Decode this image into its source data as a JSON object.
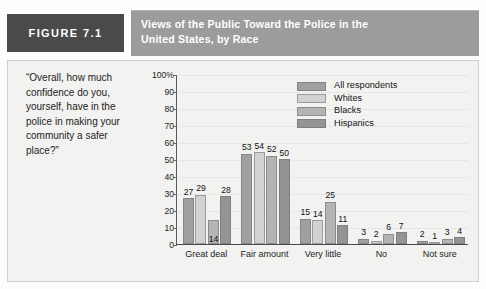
{
  "figure": {
    "badge_label": "FIGURE 7.1",
    "title_line1": "Views of the Public Toward the Police in the",
    "title_line2": "United States, by Race",
    "quote": "“Overall, how much confidence do you, yourself, have in the police in making your community a safer place?”"
  },
  "colors": {
    "badge_bg": "#4a4a4a",
    "title_bg": "#9c9c9c",
    "panel_bg": "#f2f2f0",
    "series_all": "#a0a0a0",
    "series_whites": "#d2d2d2",
    "series_blacks": "#b4b4b4",
    "series_hispanics": "#949494"
  },
  "chart_data": {
    "type": "bar",
    "title": "Views of the Public Toward the Police in the United States, by Race",
    "xlabel": "",
    "ylabel": "",
    "ylim": [
      0,
      100
    ],
    "yticks": [
      "0",
      "10",
      "20",
      "30",
      "40",
      "50",
      "60",
      "70",
      "80",
      "90",
      "100%"
    ],
    "ytick_values": [
      0,
      10,
      20,
      30,
      40,
      50,
      60,
      70,
      80,
      90,
      100
    ],
    "grid": true,
    "legend_position": "upper center",
    "categories": [
      "Great deal",
      "Fair amount",
      "Very little",
      "No",
      "Not sure"
    ],
    "series": [
      {
        "name": "All respondents",
        "color": "#a0a0a0",
        "values": [
          27,
          53,
          15,
          3,
          2
        ]
      },
      {
        "name": "Whites",
        "color": "#d2d2d2",
        "values": [
          29,
          54,
          14,
          2,
          1
        ]
      },
      {
        "name": "Blacks",
        "color": "#b4b4b4",
        "values": [
          14,
          52,
          25,
          6,
          3
        ]
      },
      {
        "name": "Hispanics",
        "color": "#949494",
        "values": [
          28,
          50,
          11,
          7,
          4
        ]
      }
    ]
  }
}
